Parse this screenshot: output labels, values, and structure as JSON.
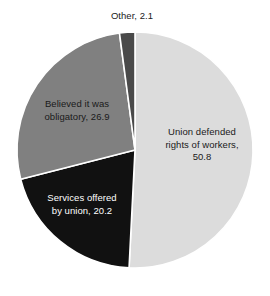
{
  "chart_data": {
    "type": "pie",
    "title": "",
    "subtitle": "",
    "xlabel": "",
    "ylabel": "",
    "legend_position": "none",
    "grid": false,
    "units": "percent",
    "start_angle_deg": 0,
    "direction": "clockwise",
    "categories": [
      "Union defended rights of workers",
      "Services offered by union",
      "Believed it was obligatory",
      "Other"
    ],
    "values": [
      50.8,
      20.2,
      26.9,
      2.1
    ],
    "slices": [
      {
        "name": "Union defended rights of workers",
        "value": 50.8,
        "label": "Union defended\nrights of workers,\n50.8",
        "color": "#dcdcdc",
        "label_color": "#1a1a1a",
        "label_placement": "inside"
      },
      {
        "name": "Services offered by union",
        "value": 20.2,
        "label": "Services offered\nby union, 20.2",
        "color": "#111111",
        "label_color": "#ffffff",
        "label_placement": "inside"
      },
      {
        "name": "Believed it was obligatory",
        "value": 26.9,
        "label": "Believed it was\nobligatory, 26.9",
        "color": "#808080",
        "label_color": "#1a1a1a",
        "label_placement": "inside"
      },
      {
        "name": "Other",
        "value": 2.1,
        "label": "Other, 2.1",
        "color": "#4a4a4a",
        "label_color": "#1a1a1a",
        "label_placement": "outside-top"
      }
    ]
  },
  "style": {
    "background": "#ffffff",
    "separator_color": "#ffffff",
    "separator_width": 1.6
  },
  "geometry": {
    "center_x": 135,
    "center_y": 150,
    "radius": 118
  }
}
